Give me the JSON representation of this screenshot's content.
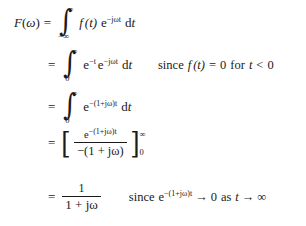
{
  "document": {
    "type": "math-derivation",
    "title": "Fourier transform of a one-sided decaying exponential",
    "background_color": "#ffffff",
    "text_color": "#1a1a1a"
  },
  "equations": [
    {
      "id": "line-1",
      "lhs": "F(ω)",
      "relation": "=",
      "rhs": "∫_{-∞}^{∞} f(t) e^{-jωt} dt",
      "parts": {
        "lhs_F": "F",
        "lhs_paren_open": "(",
        "lhs_omega": "ω",
        "lhs_paren_close": ")",
        "equals": "=",
        "integral_glyph": "∫",
        "upper_limit": "∞",
        "lower_limit": "−∞",
        "integrand_f": "f",
        "integrand_t": "(t)",
        "exp_base": "e",
        "exp_power": "−jωt",
        "differential": "dt"
      },
      "annotation": ""
    },
    {
      "id": "line-2",
      "relation": "=",
      "rhs": "∫_{0}^{∞} e^{-t} e^{-jωt} dt",
      "parts": {
        "equals": "=",
        "integral_glyph": "∫",
        "upper_limit": "∞",
        "lower_limit": "0",
        "exp1_base": "e",
        "exp1_power": "−t",
        "exp2_base": "e",
        "exp2_power": "−jωt",
        "differential": "dt"
      },
      "annotation": "since f(t) = 0 for t < 0",
      "annotation_parts": {
        "since": "since",
        "f": "f",
        "of_t": "(t)",
        "equals": "=",
        "zero": "0",
        "for": "for",
        "t": "t",
        "less_than": "<",
        "zero2": "0"
      }
    },
    {
      "id": "line-3",
      "relation": "=",
      "rhs": "∫_{0}^{∞} e^{-(1+jω)t} dt",
      "parts": {
        "equals": "=",
        "integral_glyph": "∫",
        "upper_limit": "∞",
        "lower_limit": "0",
        "exp_base": "e",
        "exp_power": "−(1+jω)t",
        "differential": "dt"
      },
      "annotation": ""
    },
    {
      "id": "line-4",
      "relation": "=",
      "rhs": "[ e^{-(1+jω)t} / -(1 + jω) ]_{0}^{∞}",
      "parts": {
        "equals": "=",
        "bracket_open": "[",
        "bracket_close": "]",
        "numerator_base": "e",
        "numerator_power": "−(1+jω)t",
        "denominator": "−(1 + jω)",
        "upper_limit": "∞",
        "lower_limit": "0"
      },
      "annotation": ""
    },
    {
      "id": "line-5",
      "relation": "=",
      "rhs": "1 / (1 + jω)",
      "parts": {
        "equals": "=",
        "numerator": "1",
        "denominator": "1 + jω"
      },
      "annotation": "since e^{-(1+jω)t} → 0 as t → ∞",
      "annotation_parts": {
        "since": "since",
        "exp_base": "e",
        "exp_power": "−(1+jω)t",
        "arrow1": "→",
        "zero": "0",
        "as": "as",
        "t": "t",
        "arrow2": "→",
        "infinity": "∞"
      }
    }
  ]
}
